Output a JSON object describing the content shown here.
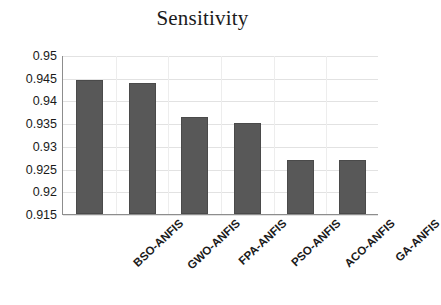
{
  "chart_data": {
    "type": "bar",
    "title": "Sensitivity",
    "xlabel": "",
    "ylabel": "",
    "categories": [
      "BSO-ANFIS",
      "GWO-ANFIS",
      "FPA-ANFIS",
      "PSO-ANFIS",
      "ACO-ANFIS",
      "GA-ANFIS"
    ],
    "values": [
      0.9445,
      0.9438,
      0.9363,
      0.935,
      0.927,
      0.927
    ],
    "ylim": [
      0.915,
      0.95
    ],
    "ytick_values": [
      0.915,
      0.92,
      0.925,
      0.93,
      0.935,
      0.94,
      0.945,
      0.95
    ],
    "ytick_labels": [
      "0.915",
      "0.92",
      "0.925",
      "0.93",
      "0.935",
      "0.94",
      "0.945",
      "0.95"
    ],
    "ytick_step": 0.005,
    "grid": true,
    "legend": false,
    "legend_position": "none",
    "series": [
      {
        "name": "Sensitivity",
        "color": "#585858",
        "values": [
          0.9445,
          0.9438,
          0.9363,
          0.935,
          0.927,
          0.927
        ]
      }
    ]
  },
  "style": {
    "bar_color": "#585858",
    "bar_edge_color": "#4a4a4a",
    "axis_color": "#8d8d8d",
    "grid_color": "#e2e2e2",
    "text_color": "#1a1a1a",
    "background": "#ffffff"
  }
}
